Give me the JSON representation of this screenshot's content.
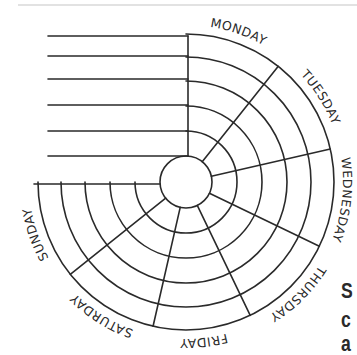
{
  "diagram": {
    "type": "weekly-planner-wheel",
    "center": {
      "x": 186,
      "y": 182
    },
    "inner_circle_radius": 26,
    "ring_radii": [
      51,
      76,
      101,
      125,
      148
    ],
    "label_radius": 157,
    "start_angle_deg": 90,
    "sweep_deg": 270,
    "stroke_color": "#2a2a2a",
    "stroke_width": 1.6,
    "days": [
      {
        "label": "MONDAY"
      },
      {
        "label": "TUESDAY"
      },
      {
        "label": "WEDNESDAY"
      },
      {
        "label": "THURSDAY"
      },
      {
        "label": "FRIDAY"
      },
      {
        "label": "SATURDAY"
      },
      {
        "label": "SUNDAY"
      }
    ],
    "top_lines": {
      "x_start": 48,
      "x_end": 188,
      "y_values": [
        36,
        56,
        79,
        105,
        131,
        156
      ]
    },
    "sunday_baseline": {
      "x_start": 34,
      "x_end": 160,
      "y": 184
    }
  },
  "side_text": {
    "letters": [
      "S",
      "c",
      "a"
    ]
  }
}
